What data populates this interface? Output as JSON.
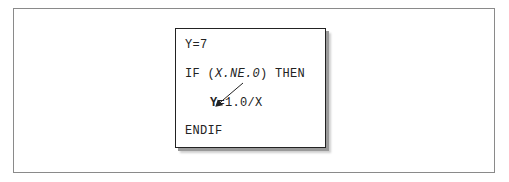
{
  "code": {
    "line1": "Y=7",
    "line2_kw": "IF (",
    "line2_cond": "X.NE.0",
    "line2_end": ") THEN",
    "line3_target": "Y",
    "line3_rest": "=1.0/X",
    "line4": "ENDIF"
  },
  "arrow": {
    "from": "X.NE.0",
    "to": "Y",
    "color": "#222222"
  }
}
